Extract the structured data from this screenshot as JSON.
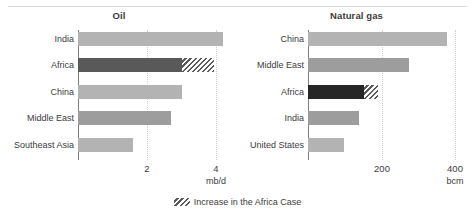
{
  "legend": {
    "increase_label": "Increase in the Africa Case",
    "swatch_name": "hatched-increase-swatch"
  },
  "colors": {
    "bar_light": "#b3b3b3",
    "bar_mid": "#9d9d9d",
    "africa_oil": "#595959",
    "africa_gas": "#262626",
    "hatch": "#5a5a5a",
    "axis": "#808080",
    "grid": "#c8c8c8",
    "text": "#3c3c3c",
    "rule": "#d9d9d9"
  },
  "chart_data": [
    {
      "type": "bar",
      "orientation": "horizontal",
      "title": "Oil",
      "xlabel": "mb/d",
      "ylabel": "",
      "unit": "mb/d",
      "xlim": [
        0,
        4.8
      ],
      "xticks": [
        2,
        4
      ],
      "xtick_labels": [
        "2",
        "4"
      ],
      "grid": true,
      "grid_axis": "x",
      "legend_position": "bottom-center",
      "categories": [
        "India",
        "Africa",
        "China",
        "Middle East",
        "Southeast Asia"
      ],
      "series": [
        {
          "name": "Base",
          "values": [
            4.2,
            3.0,
            3.0,
            2.7,
            1.6
          ]
        },
        {
          "name": "Increase in the Africa Case",
          "values": [
            0,
            0.95,
            0,
            0,
            0
          ]
        }
      ],
      "highlight_category": "Africa"
    },
    {
      "type": "bar",
      "orientation": "horizontal",
      "title": "Natural gas",
      "xlabel": "bcm",
      "ylabel": "",
      "unit": "bcm",
      "xlim": [
        0,
        440
      ],
      "xticks": [
        200,
        400
      ],
      "xtick_labels": [
        "200",
        "400"
      ],
      "grid": true,
      "grid_axis": "x",
      "legend_position": "bottom-center",
      "categories": [
        "China",
        "Middle East",
        "Africa",
        "India",
        "United States"
      ],
      "series": [
        {
          "name": "Base",
          "values": [
            378,
            275,
            152,
            138,
            98
          ]
        },
        {
          "name": "Increase in the Africa Case",
          "values": [
            0,
            0,
            38,
            0,
            0
          ]
        }
      ],
      "highlight_category": "Africa"
    }
  ]
}
